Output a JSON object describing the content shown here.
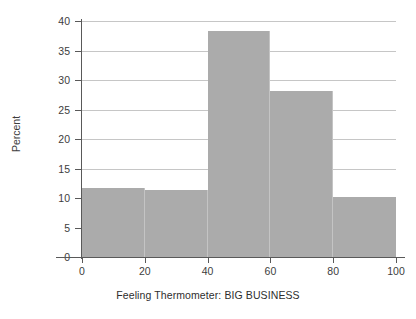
{
  "chart_data": {
    "type": "bar",
    "title": "",
    "subtitle": "",
    "xlabel": "Feeling Thermometer: BIG BUSINESS",
    "ylabel": "Percent",
    "categories": [
      "0-20",
      "20-40",
      "40-60",
      "60-80",
      "80-100"
    ],
    "bin_edges": [
      0,
      20,
      40,
      60,
      80,
      100
    ],
    "values": [
      11.7,
      11.3,
      38.3,
      28.2,
      10.2
    ],
    "xlim": [
      0,
      100
    ],
    "ylim": [
      0,
      40
    ],
    "xticks": [
      "0",
      "20",
      "40",
      "60",
      "80",
      "100"
    ],
    "xtick_values": [
      0,
      20,
      40,
      60,
      80,
      100
    ],
    "yticks": [
      "0",
      "5",
      "10",
      "15",
      "20",
      "25",
      "30",
      "35",
      "40"
    ],
    "ytick_values": [
      0,
      5,
      10,
      15,
      20,
      25,
      30,
      35,
      40
    ],
    "grid": "horizontal",
    "legend": "none",
    "bar_color": "#ababab",
    "grid_color": "#c6c6c6",
    "axis_color": "#595959",
    "background_color": "#ffffff",
    "text_color": "#3d3d3d"
  }
}
